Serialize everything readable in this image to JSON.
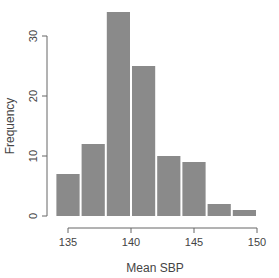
{
  "chart_data": {
    "type": "bar",
    "subtype": "histogram",
    "title": "",
    "xlabel": "Mean SBP",
    "ylabel": "Frequency",
    "bin_edges": [
      134,
      136,
      138,
      140,
      142,
      144,
      146,
      148,
      150
    ],
    "categories": [
      "134-136",
      "136-138",
      "138-140",
      "140-142",
      "142-144",
      "144-146",
      "146-148",
      "148-150"
    ],
    "values": [
      7,
      12,
      34,
      25,
      10,
      9,
      2,
      1
    ],
    "xticks": [
      135,
      140,
      145,
      150
    ],
    "yticks": [
      0,
      10,
      20,
      30
    ],
    "xlim": [
      134,
      150
    ],
    "ylim": [
      0,
      34
    ],
    "grid": false,
    "legend": null,
    "colors": {
      "bar": "#8a8a8a",
      "bar_edge": "#ffffff",
      "axis": "#666666"
    }
  }
}
